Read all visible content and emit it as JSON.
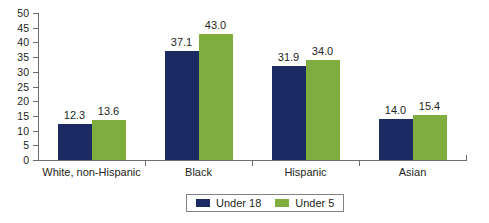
{
  "chart_data": {
    "type": "bar",
    "title": "",
    "subtitle": "",
    "xlabel": "",
    "ylabel": "",
    "ylim": [
      0,
      50
    ],
    "ytick_labels": [
      "50",
      "45",
      "40",
      "35",
      "30",
      "25",
      "20",
      "15",
      "10",
      "5",
      "0"
    ],
    "ytick_values": [
      50,
      45,
      40,
      35,
      30,
      25,
      20,
      15,
      10,
      5,
      0
    ],
    "grid": false,
    "legend_position": "bottom-center",
    "categories": [
      "White, non-Hispanic",
      "Black",
      "Hispanic",
      "Asian"
    ],
    "series": [
      {
        "name": "Under 18",
        "color": "#1b2a63",
        "values": [
          12.3,
          37.1,
          31.9,
          14.0
        ],
        "labels": [
          "12.3",
          "37.1",
          "31.9",
          "14.0"
        ]
      },
      {
        "name": "Under 5",
        "color": "#7fad3e",
        "values": [
          13.6,
          43.0,
          34.0,
          15.4
        ],
        "labels": [
          "13.6",
          "43.0",
          "34.0",
          "15.4"
        ]
      }
    ]
  },
  "legend": {
    "entries": [
      {
        "label": "Under 18",
        "swatch": "under18"
      },
      {
        "label": "Under 5",
        "swatch": "under5"
      }
    ]
  },
  "colors": {
    "under18": "#1b2a63",
    "under5": "#7fad3e",
    "axis": "#6d6e71",
    "text": "#231f20",
    "background": "#ffffff"
  }
}
